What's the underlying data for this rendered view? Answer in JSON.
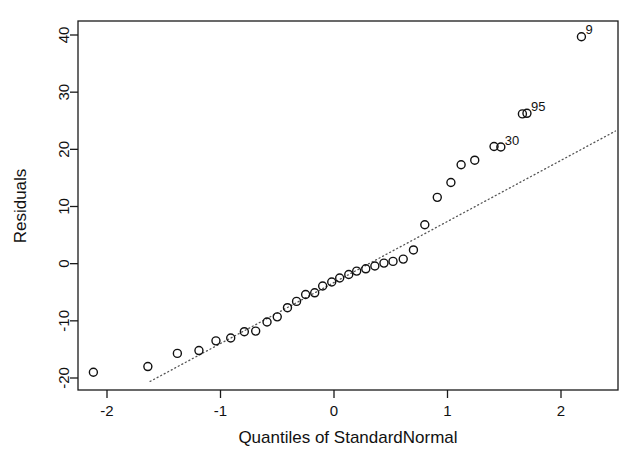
{
  "chart_data": {
    "type": "scatter",
    "title": "",
    "xlabel": "Quantiles of StandardNormal",
    "ylabel": "Residuals",
    "xlim": [
      -2.34,
      2.48
    ],
    "ylim": [
      -21.3,
      42.6
    ],
    "xticks": [
      -2,
      -1,
      0,
      1,
      2
    ],
    "xtick_labels": [
      "-2",
      "-1",
      "0",
      "1",
      "2"
    ],
    "yticks": [
      -20,
      -10,
      0,
      10,
      20,
      30,
      40
    ],
    "ytick_labels": [
      "-20",
      "-10",
      "0",
      "10",
      "20",
      "30",
      "40"
    ],
    "grid": false,
    "legend": "none",
    "marker": "open-circle",
    "points": [
      {
        "x": -2.12,
        "y": -19.0
      },
      {
        "x": -1.64,
        "y": -18.0
      },
      {
        "x": -1.38,
        "y": -15.7
      },
      {
        "x": -1.19,
        "y": -15.2
      },
      {
        "x": -1.04,
        "y": -13.5
      },
      {
        "x": -0.91,
        "y": -13.0
      },
      {
        "x": -0.79,
        "y": -11.9
      },
      {
        "x": -0.69,
        "y": -11.8
      },
      {
        "x": -0.59,
        "y": -10.2
      },
      {
        "x": -0.5,
        "y": -9.3
      },
      {
        "x": -0.41,
        "y": -7.7
      },
      {
        "x": -0.33,
        "y": -6.6
      },
      {
        "x": -0.25,
        "y": -5.4
      },
      {
        "x": -0.17,
        "y": -5.1
      },
      {
        "x": -0.1,
        "y": -3.9
      },
      {
        "x": -0.02,
        "y": -3.2
      },
      {
        "x": 0.05,
        "y": -2.5
      },
      {
        "x": 0.13,
        "y": -1.9
      },
      {
        "x": 0.2,
        "y": -1.3
      },
      {
        "x": 0.28,
        "y": -0.9
      },
      {
        "x": 0.36,
        "y": -0.4
      },
      {
        "x": 0.44,
        "y": 0.1
      },
      {
        "x": 0.52,
        "y": 0.4
      },
      {
        "x": 0.61,
        "y": 0.8
      },
      {
        "x": 0.7,
        "y": 2.4
      },
      {
        "x": 0.8,
        "y": 6.8
      },
      {
        "x": 0.91,
        "y": 11.6
      },
      {
        "x": 1.03,
        "y": 14.2
      },
      {
        "x": 1.12,
        "y": 17.3
      },
      {
        "x": 1.24,
        "y": 18.1
      },
      {
        "x": 1.41,
        "y": 20.5
      },
      {
        "x": 1.47,
        "y": 20.4
      },
      {
        "x": 1.66,
        "y": 26.2
      },
      {
        "x": 1.7,
        "y": 26.3
      },
      {
        "x": 2.18,
        "y": 39.7
      }
    ],
    "labeled_points": [
      {
        "id": "9",
        "x": 2.18,
        "y": 39.7,
        "dx": 4,
        "dy": -3
      },
      {
        "id": "95",
        "x": 1.7,
        "y": 26.3,
        "dx": 4,
        "dy": -2
      },
      {
        "id": "30",
        "x": 1.47,
        "y": 20.4,
        "dx": 4,
        "dy": -2
      }
    ],
    "reference_line": {
      "style": "dotted",
      "x1": -1.62,
      "y1": -20.6,
      "x2": 2.48,
      "y2": 23.2
    }
  },
  "colors": {
    "background": "#ffffff",
    "axis": "#1a1a1a",
    "point": "#111111",
    "reference_line": "#555555",
    "text": "#111111"
  }
}
